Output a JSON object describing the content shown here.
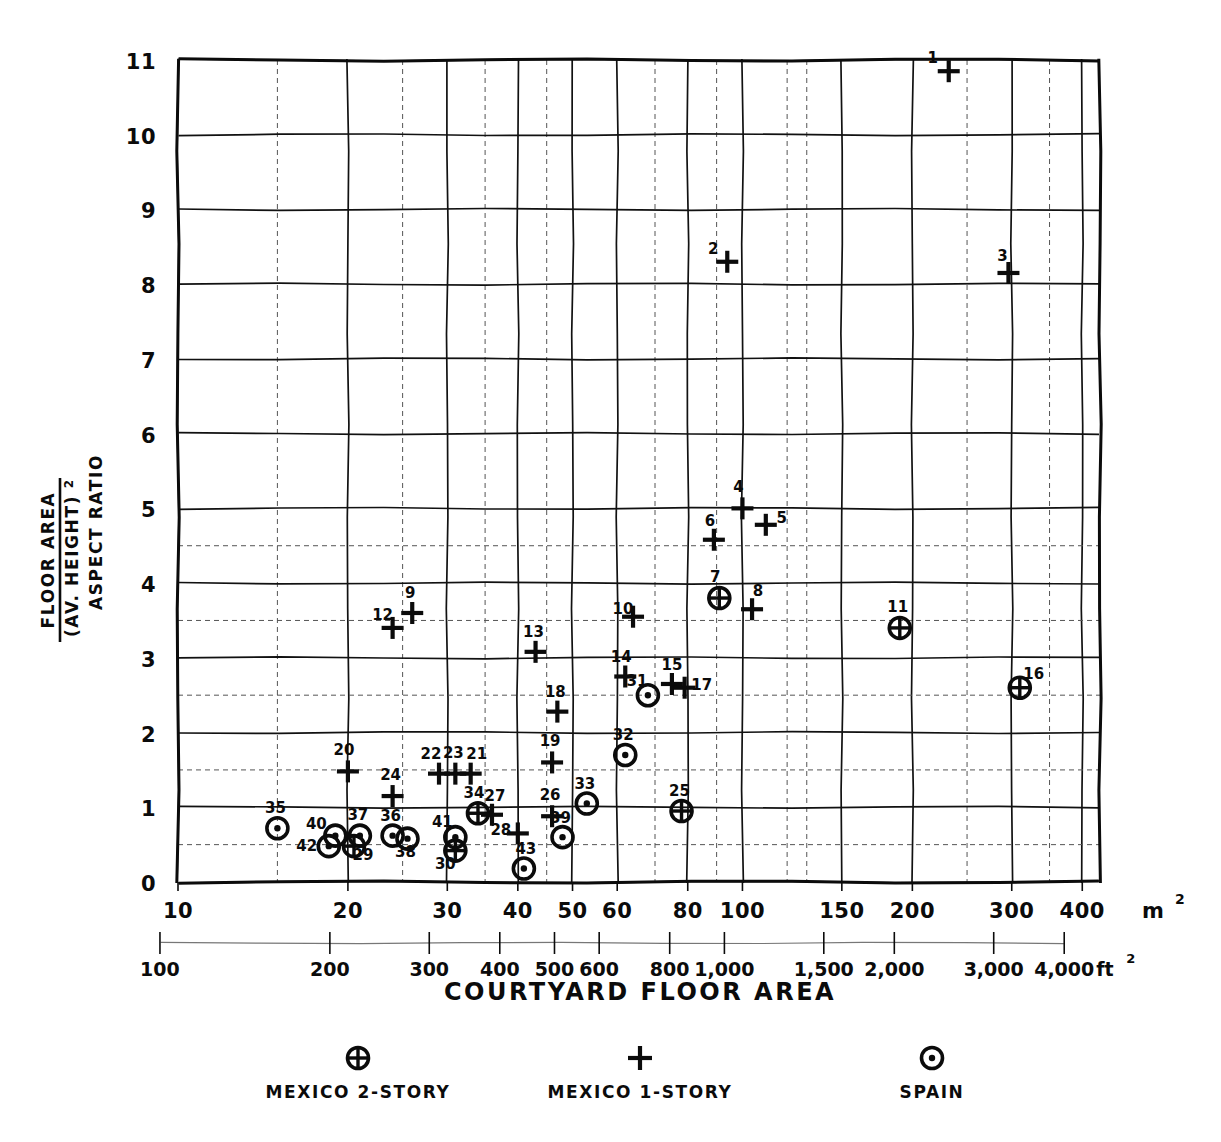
{
  "chart_data": {
    "type": "scatter",
    "title": "",
    "xlabel": "COURTYARD FLOOR AREA",
    "ylabel": "FLOOR AREA / (AV. HEIGHT)²  ASPECT RATIO",
    "ylabel_lines": [
      "FLOOR AREA",
      "(AV. HEIGHT)²",
      "ASPECT RATIO"
    ],
    "xscale": "log",
    "yscale": "linear",
    "xlim": [
      10,
      430
    ],
    "ylim": [
      0,
      11
    ],
    "grid": true,
    "legend_position": "below-axis",
    "x_unit_primary": "m²",
    "x_unit_secondary": "ft²",
    "x_ticks_m2": [
      "10",
      "20",
      "30",
      "40",
      "50",
      "60",
      "80",
      "100",
      "150",
      "200",
      "300",
      "400"
    ],
    "x_tick_values_m2": [
      10,
      20,
      30,
      40,
      50,
      60,
      80,
      100,
      150,
      200,
      300,
      400
    ],
    "x_ticks_ft2": [
      "100",
      "200",
      "300",
      "400",
      "500",
      "600",
      "800",
      "1,000",
      "1,500",
      "2,000",
      "3,000",
      "4,000"
    ],
    "x_tick_values_ft2": [
      100,
      200,
      300,
      400,
      500,
      600,
      800,
      1000,
      1500,
      2000,
      3000,
      4000
    ],
    "y_ticks": [
      "0",
      "1",
      "2",
      "3",
      "4",
      "5",
      "6",
      "7",
      "8",
      "9",
      "10",
      "11"
    ],
    "y_tick_values": [
      0,
      1,
      2,
      3,
      4,
      5,
      6,
      7,
      8,
      9,
      10,
      11
    ],
    "series": [
      {
        "name": "MEXICO 2-STORY",
        "marker": "crossed-circle",
        "points": [
          {
            "label": "7",
            "x": 91,
            "y": 3.8
          },
          {
            "label": "11",
            "x": 190,
            "y": 3.4
          },
          {
            "label": "16",
            "x": 310,
            "y": 2.6
          },
          {
            "label": "25",
            "x": 78,
            "y": 0.95
          },
          {
            "label": "29",
            "x": 20.5,
            "y": 0.48
          },
          {
            "label": "30",
            "x": 31,
            "y": 0.42
          },
          {
            "label": "34",
            "x": 34,
            "y": 0.92
          }
        ]
      },
      {
        "name": "MEXICO 1-STORY",
        "marker": "plus",
        "points": [
          {
            "label": "1",
            "x": 232,
            "y": 10.85
          },
          {
            "label": "2",
            "x": 94,
            "y": 8.3
          },
          {
            "label": "3",
            "x": 296,
            "y": 8.15
          },
          {
            "label": "4",
            "x": 100,
            "y": 5.0
          },
          {
            "label": "5",
            "x": 110,
            "y": 4.78
          },
          {
            "label": "6",
            "x": 89,
            "y": 4.58
          },
          {
            "label": "8",
            "x": 104,
            "y": 3.65
          },
          {
            "label": "9",
            "x": 26,
            "y": 3.6
          },
          {
            "label": "10",
            "x": 64,
            "y": 3.55
          },
          {
            "label": "12",
            "x": 24,
            "y": 3.4
          },
          {
            "label": "13",
            "x": 43,
            "y": 3.08
          },
          {
            "label": "14",
            "x": 62,
            "y": 2.75
          },
          {
            "label": "15",
            "x": 75,
            "y": 2.65
          },
          {
            "label": "17",
            "x": 79,
            "y": 2.6
          },
          {
            "label": "18",
            "x": 47,
            "y": 2.28
          },
          {
            "label": "19",
            "x": 46,
            "y": 1.6
          },
          {
            "label": "20",
            "x": 20,
            "y": 1.48
          },
          {
            "label": "21",
            "x": 33,
            "y": 1.45
          },
          {
            "label": "22",
            "x": 29,
            "y": 1.45
          },
          {
            "label": "23",
            "x": 31,
            "y": 1.45
          },
          {
            "label": "24",
            "x": 24,
            "y": 1.15
          },
          {
            "label": "26",
            "x": 46,
            "y": 0.88
          },
          {
            "label": "27",
            "x": 36,
            "y": 0.9
          },
          {
            "label": "28",
            "x": 40,
            "y": 0.65
          }
        ]
      },
      {
        "name": "SPAIN",
        "marker": "dotted-circle",
        "points": [
          {
            "label": "31",
            "x": 68,
            "y": 2.5
          },
          {
            "label": "32",
            "x": 62,
            "y": 1.7
          },
          {
            "label": "33",
            "x": 53,
            "y": 1.05
          },
          {
            "label": "35",
            "x": 15,
            "y": 0.72
          },
          {
            "label": "36",
            "x": 24,
            "y": 0.62
          },
          {
            "label": "37",
            "x": 21,
            "y": 0.62
          },
          {
            "label": "38",
            "x": 25.5,
            "y": 0.58
          },
          {
            "label": "39",
            "x": 48,
            "y": 0.6
          },
          {
            "label": "40",
            "x": 19,
            "y": 0.62
          },
          {
            "label": "41",
            "x": 31,
            "y": 0.6
          },
          {
            "label": "42",
            "x": 18.5,
            "y": 0.48
          },
          {
            "label": "43",
            "x": 41,
            "y": 0.18
          }
        ]
      }
    ]
  },
  "legend": {
    "entries": [
      {
        "marker_name": "crossed-circle-marker",
        "label": "MEXICO 2-STORY"
      },
      {
        "marker_name": "plus-marker",
        "label": "MEXICO 1-STORY"
      },
      {
        "marker_name": "dotted-circle-marker",
        "label": "SPAIN"
      }
    ]
  },
  "axis": {
    "x_title": "COURTYARD FLOOR AREA",
    "x_unit_primary": "m",
    "x_unit_primary_sup": "2",
    "x_unit_secondary": "ft",
    "x_unit_secondary_sup": "2",
    "y_title_line1": "FLOOR AREA",
    "y_title_line2": "(AV. HEIGHT)",
    "y_title_line2_sup": "2",
    "y_title_line3": "ASPECT RATIO"
  }
}
